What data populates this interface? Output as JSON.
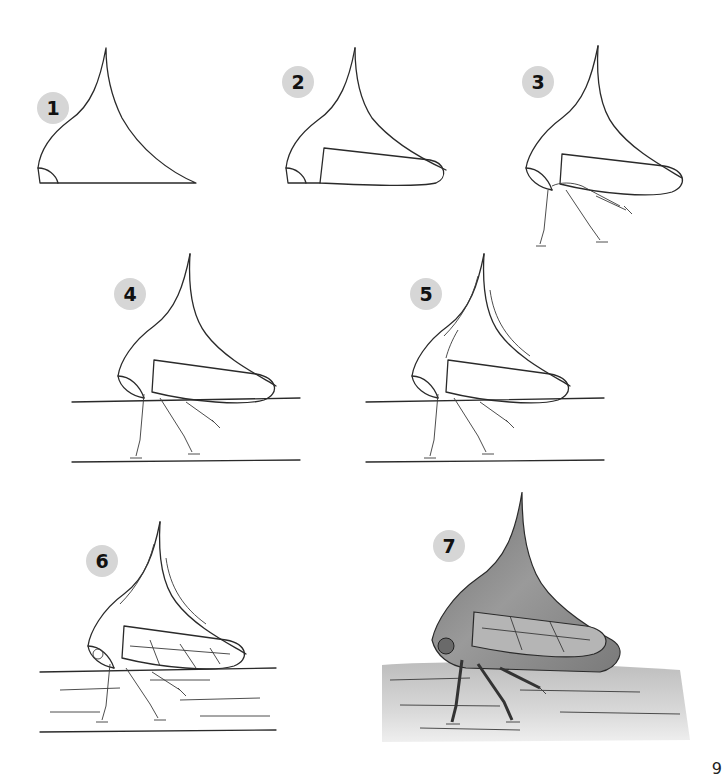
{
  "steps": [
    {
      "number": "1",
      "badge_x": 37,
      "badge_y": 92,
      "description": "Outline of thorn-shaped pronotum with head"
    },
    {
      "number": "2",
      "badge_x": 282,
      "badge_y": 66,
      "description": "Add folded wing"
    },
    {
      "number": "3",
      "badge_x": 522,
      "badge_y": 66,
      "description": "Add legs"
    },
    {
      "number": "4",
      "badge_x": 114,
      "badge_y": 278,
      "description": "Add branch surface lines"
    },
    {
      "number": "5",
      "badge_x": 410,
      "badge_y": 278,
      "description": "Add pronotum markings"
    },
    {
      "number": "6",
      "badge_x": 86,
      "badge_y": 545,
      "description": "Add wing veins and bark texture"
    },
    {
      "number": "7",
      "badge_x": 433,
      "badge_y": 530,
      "description": "Shade the final drawing"
    }
  ],
  "corner_mark": "9",
  "colors": {
    "badge": "#d6d6d6",
    "line": "#2a2a2a",
    "shade_body": "#8a8a8a",
    "background": "#ffffff"
  }
}
